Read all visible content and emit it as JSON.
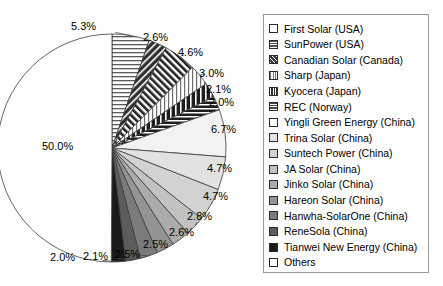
{
  "chart_data": {
    "type": "pie",
    "title": "",
    "subtitle": "",
    "xlabel": "",
    "ylabel": "",
    "legend_position": "right",
    "grid": false,
    "units": "percent",
    "start_angle_deg": 90,
    "direction": "clockwise",
    "categories": [
      "First Solar (USA)",
      "SunPower (USA)",
      "Canadian Solar (Canada)",
      "Sharp (Japan)",
      "Kyocera (Japan)",
      "REC (Norway)",
      "Yingli Green Energy (China)",
      "Trina Solar (China)",
      "Suntech Power (China)",
      "JA Solar (China)",
      "Jinko Solar (China)",
      "Hareon Solar (China)",
      "Hanwha-SolarOne (China)",
      "ReneSola (China)",
      "Tianwei New Energy (China)",
      "Others"
    ],
    "values": [
      5.3,
      2.6,
      4.6,
      3.0,
      2.1,
      2.0,
      6.7,
      4.7,
      4.7,
      2.8,
      2.6,
      2.5,
      2.5,
      2.1,
      2.0,
      50.0
    ],
    "data_labels": [
      "5.3%",
      "2.6%",
      "4.6%",
      "3.0%",
      "2.1%",
      "2.0%",
      "6.7%",
      "4.7%",
      "4.7%",
      "2.8%",
      "2.6%",
      "2.5%",
      "2.5%",
      "2.1%",
      "2.0%",
      "50.0%"
    ]
  },
  "legend": {
    "items": [
      {
        "label": "First Solar (USA)",
        "swatch": "white-plain",
        "fill": "#ffffff"
      },
      {
        "label": "SunPower (USA)",
        "swatch": "dark-horizontal-bands",
        "fill": "#555555"
      },
      {
        "label": "Canadian Solar (Canada)",
        "swatch": "dark-diagonal-hatch",
        "fill": "#3a3a3a"
      },
      {
        "label": "Sharp (Japan)",
        "swatch": "light-vertical-lines",
        "fill": "#d9d9d9"
      },
      {
        "label": "Kyocera (Japan)",
        "swatch": "dark-vertical-bands",
        "fill": "#2e2e2e"
      },
      {
        "label": "REC (Norway)",
        "swatch": "horizontal-bands",
        "fill": "#4a4a4a"
      },
      {
        "label": "Yingli Green Energy (China)",
        "swatch": "white-plain",
        "fill": "#f2f2f2"
      },
      {
        "label": "Trina Solar (China)",
        "swatch": "very-light-gray",
        "fill": "#e2e2e2"
      },
      {
        "label": "Suntech Power (China)",
        "swatch": "light-gray",
        "fill": "#d2d2d2"
      },
      {
        "label": "JA Solar (China)",
        "swatch": "light-mid-gray",
        "fill": "#c2c2c2"
      },
      {
        "label": "Jinko Solar (China)",
        "swatch": "mid-gray",
        "fill": "#ababab"
      },
      {
        "label": "Hareon Solar (China)",
        "swatch": "mid-dark-gray",
        "fill": "#949494"
      },
      {
        "label": "Hanwha-SolarOne (China)",
        "swatch": "dark-gray",
        "fill": "#7b7b7b"
      },
      {
        "label": "ReneSola (China)",
        "swatch": "darker-gray",
        "fill": "#5c5c5c"
      },
      {
        "label": "Tianwei New Energy (China)",
        "swatch": "near-black",
        "fill": "#1a1a1a"
      },
      {
        "label": "Others",
        "swatch": "white-plain",
        "fill": "#ffffff"
      }
    ]
  },
  "pie": {
    "center_x": 112,
    "center_y": 148,
    "radius": 114,
    "label_positions": [
      {
        "text": "5.3%",
        "x": 71,
        "y": 21
      },
      {
        "text": "2.6%",
        "x": 143,
        "y": 32
      },
      {
        "text": "4.6%",
        "x": 178,
        "y": 47
      },
      {
        "text": "3.0%",
        "x": 199,
        "y": 68
      },
      {
        "text": "2.1%",
        "x": 206,
        "y": 84
      },
      {
        "text": "2.0%",
        "x": 209,
        "y": 97
      },
      {
        "text": "6.7%",
        "x": 211,
        "y": 124
      },
      {
        "text": "4.7%",
        "x": 207,
        "y": 163
      },
      {
        "text": "4.7%",
        "x": 203,
        "y": 191
      },
      {
        "text": "2.8%",
        "x": 187,
        "y": 211
      },
      {
        "text": "2.6%",
        "x": 169,
        "y": 227
      },
      {
        "text": "2.5%",
        "x": 143,
        "y": 239
      },
      {
        "text": "2.5%",
        "x": 115,
        "y": 249
      },
      {
        "text": "2.1%",
        "x": 83,
        "y": 251
      },
      {
        "text": "2.0%",
        "x": 50,
        "y": 252
      },
      {
        "text": "50.0%",
        "x": 42,
        "y": 141
      }
    ]
  }
}
